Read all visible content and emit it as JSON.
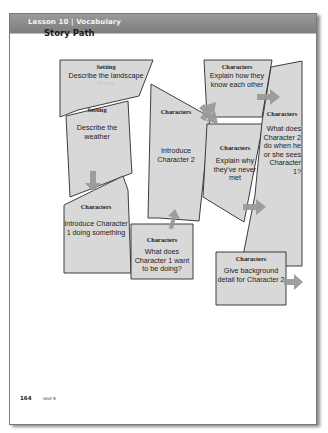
{
  "header": {
    "title": "Lesson 10 | Vocabulary"
  },
  "section": {
    "title": "Story Path"
  },
  "colors": {
    "header": "#858585",
    "shape_fill": "#d8d8d8",
    "shape_stroke": "#2a2a2a",
    "arrow": "#9a9a9a"
  },
  "nodes": [
    {
      "id": "landscape",
      "category": "Setting",
      "text": "Describe the landscape",
      "marker": "START"
    },
    {
      "id": "weather",
      "category": "Setting",
      "text": "Describe the weather"
    },
    {
      "id": "introduce-char1",
      "category": "Characters",
      "text": "Introduce Character 1 doing something"
    },
    {
      "id": "char1-want",
      "category": "Characters",
      "text": "What does Character 1 want to be doing?"
    },
    {
      "id": "introduce-char2",
      "category": "Characters",
      "text": "Introduce Character 2"
    },
    {
      "id": "know-each-other",
      "category": "Characters",
      "text": "Explain how they know each other"
    },
    {
      "id": "never-met",
      "category": "Characters",
      "text": "Explain why they've never met"
    },
    {
      "id": "char2-reaction",
      "category": "Characters",
      "text": "What does Character 2 do when he or she sees Character 1?"
    },
    {
      "id": "background-char2",
      "category": "Characters",
      "text": "Give background detail for Character 2"
    }
  ],
  "footer": {
    "page_number": "164",
    "unit": "Unit 9"
  }
}
